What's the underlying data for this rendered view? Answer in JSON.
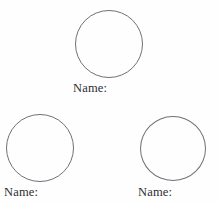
{
  "page": {
    "background_color": "#fefefe",
    "width": 218,
    "height": 205
  },
  "style": {
    "outline_color": "#70707a",
    "text_color": "#2d2d33"
  },
  "groups": [
    {
      "id": "group-1",
      "position": "top-center",
      "shape": "circle",
      "label": "Name:",
      "value": ""
    },
    {
      "id": "group-2",
      "position": "bottom-left",
      "shape": "circle",
      "label": "Name:",
      "value": ""
    },
    {
      "id": "group-3",
      "position": "bottom-right",
      "shape": "circle",
      "label": "Name:",
      "value": ""
    }
  ]
}
